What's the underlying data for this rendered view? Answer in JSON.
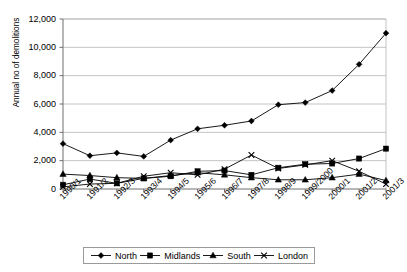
{
  "chart_data": {
    "type": "line",
    "title": "",
    "xlabel": "",
    "ylabel": "Annual no of demolitions",
    "ylim": [
      0,
      12000
    ],
    "ytick_step": 2000,
    "ytick_labels": [
      "12,000",
      "10,000",
      "8,000",
      "6,000",
      "4,000",
      "2,000",
      "0"
    ],
    "grid": true,
    "legend_position": "bottom",
    "categories": [
      "1990/1",
      "1991/2",
      "1992/3",
      "1993/4",
      "1994/5",
      "1995/6",
      "1996/7",
      "1997/8",
      "1998/9",
      "1999/2000",
      "2000/1",
      "2001/2",
      "2001/3"
    ],
    "series": [
      {
        "name": "North",
        "marker": "diamond",
        "color": "#000000",
        "values": [
          3200,
          2350,
          2550,
          2300,
          3450,
          4250,
          4500,
          4800,
          5950,
          6100,
          6950,
          8800,
          11000
        ]
      },
      {
        "name": "Midlands",
        "marker": "square",
        "color": "#000000",
        "values": [
          300,
          700,
          400,
          750,
          900,
          1250,
          1300,
          1000,
          1500,
          1750,
          1800,
          2150,
          2850
        ]
      },
      {
        "name": "South",
        "marker": "triangle",
        "color": "#000000",
        "values": [
          1050,
          950,
          800,
          750,
          950,
          1150,
          1000,
          800,
          650,
          650,
          800,
          1050,
          600
        ]
      },
      {
        "name": "London",
        "marker": "cross",
        "color": "#000000",
        "values": [
          150,
          350,
          400,
          900,
          1150,
          1000,
          1400,
          2400,
          1450,
          1700,
          2000,
          1250,
          350
        ]
      }
    ]
  },
  "legend": {
    "items": [
      {
        "label": "North",
        "marker": "diamond"
      },
      {
        "label": "Midlands",
        "marker": "square"
      },
      {
        "label": "South",
        "marker": "triangle"
      },
      {
        "label": "London",
        "marker": "cross"
      }
    ]
  },
  "axes": {
    "y_title": "Annual no of demolitions"
  },
  "colors": {
    "grid": "#b5b5b5",
    "axis": "#6e6e6e",
    "series": "#000000",
    "legend_border": "#9a9a9a"
  },
  "clipped_header_text": ""
}
